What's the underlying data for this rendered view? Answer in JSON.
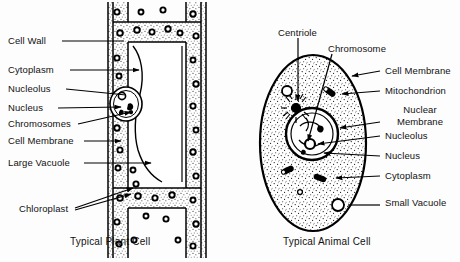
{
  "figure": {
    "background_color": "#fdfdfd",
    "ink_color": "#000000",
    "width": 460,
    "height": 262
  },
  "plant_cell": {
    "caption": "Typical Plant Cell",
    "labels": [
      {
        "id": "cell-wall",
        "text": "Cell Wall",
        "x": 8,
        "y": 36,
        "leader_to_x": 124,
        "leader_to_y": 41,
        "arrow": false
      },
      {
        "id": "cytoplasm",
        "text": "Cytoplasm",
        "x": 8,
        "y": 65,
        "leader_to_x": 140,
        "leader_to_y": 70,
        "arrow": true
      },
      {
        "id": "nucleolus",
        "text": "Nucleolus",
        "x": 8,
        "y": 84,
        "leader_to_x": 126,
        "leader_to_y": 96,
        "arrow": false
      },
      {
        "id": "nucleus",
        "text": "Nucleus",
        "x": 8,
        "y": 103,
        "leader_to_x": 122,
        "leader_to_y": 108,
        "arrow": true
      },
      {
        "id": "chromosomes",
        "text": "Chromosomes",
        "x": 8,
        "y": 120,
        "leader_to_x": 132,
        "leader_to_y": 112,
        "arrow": true
      },
      {
        "id": "cell-membrane",
        "text": "Cell Membrane",
        "x": 8,
        "y": 136,
        "leader_to_x": 122,
        "leader_to_y": 140,
        "arrow": true
      },
      {
        "id": "large-vacuole",
        "text": "Large Vacuole",
        "x": 8,
        "y": 158,
        "leader_to_x": 152,
        "leader_to_y": 162,
        "arrow": true
      },
      {
        "id": "chloroplast",
        "text": "Chloroplast",
        "x": 38,
        "y": 206,
        "leader_to_x": 134,
        "leader_to_y": 190,
        "arrow": true
      }
    ]
  },
  "animal_cell": {
    "caption": "Typical Animal Cell",
    "labels": [
      {
        "id": "centriole",
        "text": "Centriole",
        "x": 281,
        "y": 28,
        "align": "left",
        "leader_to_x": 309,
        "leader_to_y": 114,
        "arrow": true
      },
      {
        "id": "chromosome",
        "text": "Chromosome",
        "x": 327,
        "y": 44,
        "align": "left",
        "leader_to_x": 318,
        "leader_to_y": 135,
        "arrow": true
      },
      {
        "id": "cell-membrane",
        "text": "Cell Membrane",
        "x": 383,
        "y": 66,
        "align": "left",
        "leader_to_x": 356,
        "leader_to_y": 73,
        "arrow": true
      },
      {
        "id": "mitochondrion",
        "text": "Mitochondrion",
        "x": 383,
        "y": 86,
        "align": "left",
        "leader_to_x": 344,
        "leader_to_y": 92,
        "arrow": true
      },
      {
        "id": "nuclear-membrane",
        "text": "Nuclear Membrane",
        "x": 383,
        "y": 106,
        "align": "left",
        "leader_to_x": 336,
        "leader_to_y": 126,
        "arrow": true,
        "two_line": true
      },
      {
        "id": "nucleolus",
        "text": "Nucleolus",
        "x": 383,
        "y": 131,
        "align": "left",
        "leader_to_x": 330,
        "leader_to_y": 139,
        "arrow": true
      },
      {
        "id": "nucleus",
        "text": "Nucleus",
        "x": 383,
        "y": 151,
        "align": "left",
        "leader_to_x": 326,
        "leader_to_y": 148,
        "arrow": true
      },
      {
        "id": "cytoplasm",
        "text": "Cytoplasm",
        "x": 383,
        "y": 171,
        "align": "left",
        "leader_to_x": 337,
        "leader_to_y": 176,
        "arrow": true
      },
      {
        "id": "small-vacuole",
        "text": "Small Vacuole",
        "x": 383,
        "y": 198,
        "align": "left",
        "leader_to_x": 352,
        "leader_to_y": 210,
        "arrow": false,
        "two_line": true
      }
    ]
  },
  "captions": {
    "plant": {
      "text": "Typical Plant Cell",
      "x": 70,
      "y": 237
    },
    "animal": {
      "text": "Typical Animal Cell",
      "x": 283,
      "y": 237
    }
  }
}
